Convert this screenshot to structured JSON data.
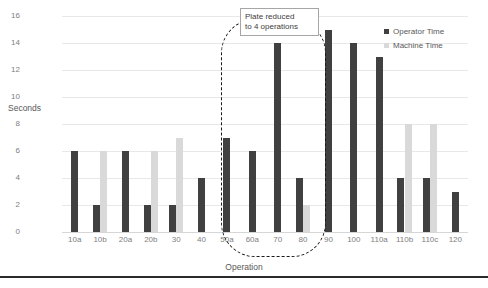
{
  "chart_data": {
    "type": "bar",
    "title": "",
    "xlabel": "Operation",
    "ylabel": "Seconds",
    "ylim": [
      0,
      16
    ],
    "ytick_values": [
      0,
      2,
      4,
      6,
      8,
      10,
      12,
      14,
      16
    ],
    "ytick_labels": [
      "0",
      "2",
      "4",
      "6",
      "8",
      "10",
      "12",
      "14",
      "16"
    ],
    "grid": true,
    "legend_position": "top-right",
    "categories": [
      "10a",
      "10b",
      "20a",
      "20b",
      "30",
      "40",
      "50a",
      "60a",
      "70",
      "80",
      "90",
      "100",
      "110a",
      "110b",
      "110c",
      "120"
    ],
    "series": [
      {
        "name": "Operator Time",
        "color": "#404040",
        "values": [
          6,
          2,
          6,
          2,
          2,
          4,
          7,
          6,
          14,
          4,
          15,
          14,
          13,
          4,
          4,
          3
        ]
      },
      {
        "name": "Machine Time",
        "color": "#d9d9d9",
        "values": [
          0,
          6,
          0,
          6,
          7,
          0,
          0,
          0,
          0,
          2,
          0,
          0,
          0,
          8,
          8,
          0
        ]
      }
    ],
    "annotations": [
      {
        "id": "plate-reduced-callout",
        "text": "Plate reduced to 4 operations",
        "line1": "Plate reduced",
        "line2": "to 4 operations",
        "shape": "dashed-rounded-rect",
        "covers_categories": [
          "50a",
          "60a",
          "70",
          "80"
        ]
      }
    ]
  },
  "legend": {
    "items": [
      {
        "label": "Operator Time",
        "swatch": "operator"
      },
      {
        "label": "Machine Time",
        "swatch": "machine"
      }
    ]
  }
}
